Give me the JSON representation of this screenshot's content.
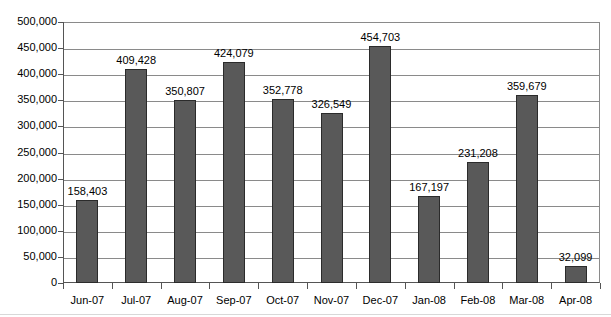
{
  "chart_data": {
    "type": "bar",
    "title": "",
    "subtitle": "",
    "xlabel": "",
    "ylabel": "",
    "categories": [
      "Jun-07",
      "Jul-07",
      "Aug-07",
      "Sep-07",
      "Oct-07",
      "Nov-07",
      "Dec-07",
      "Jan-08",
      "Feb-08",
      "Mar-08",
      "Apr-08"
    ],
    "values": [
      158403,
      409428,
      350807,
      424079,
      352778,
      326549,
      454703,
      167197,
      231208,
      359679,
      32099
    ],
    "value_labels": [
      "158,403",
      "409,428",
      "350,807",
      "424,079",
      "352,778",
      "326,549",
      "454,703",
      "167,197",
      "231,208",
      "359,679",
      "32,099"
    ],
    "ylim": [
      0,
      500000
    ],
    "ytick_values": [
      0,
      50000,
      100000,
      150000,
      200000,
      250000,
      300000,
      350000,
      400000,
      450000,
      500000
    ],
    "ytick_labels": [
      "0",
      "50,000",
      "100,000",
      "150,000",
      "200,000",
      "250,000",
      "300,000",
      "350,000",
      "400,000",
      "450,000",
      "500,000"
    ],
    "grid": true,
    "legend": null,
    "legend_position": "none",
    "series_color": "#595959",
    "gridline_color": "#8a8a8a",
    "axis_color": "#555555",
    "background_color": "#ffffff",
    "data_labels_shown": true
  }
}
